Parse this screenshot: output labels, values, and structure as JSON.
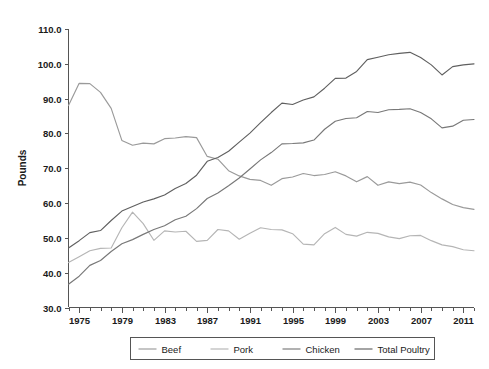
{
  "chart_data": {
    "type": "line",
    "title": "",
    "subtitle": "",
    "xlabel": "",
    "ylabel": "Pounds",
    "xlim": [
      1974,
      2012
    ],
    "ylim": [
      30.0,
      110.0
    ],
    "grid": false,
    "legend_position": "bottom",
    "y_ticks": [
      "30.0",
      "40.0",
      "50.0",
      "60.0",
      "70.0",
      "80.0",
      "90.0",
      "100.0",
      "110.0"
    ],
    "y_tick_values": [
      30,
      40,
      50,
      60,
      70,
      80,
      90,
      100,
      110
    ],
    "x_ticks": [
      "1975",
      "1979",
      "1983",
      "1987",
      "1991",
      "1995",
      "1999",
      "2003",
      "2007",
      "2011"
    ],
    "x_tick_values": [
      1975,
      1979,
      1983,
      1987,
      1991,
      1995,
      1999,
      2003,
      2007,
      2011
    ],
    "x_minor_step": 1,
    "x": [
      1974,
      1975,
      1976,
      1977,
      1978,
      1979,
      1980,
      1981,
      1982,
      1983,
      1984,
      1985,
      1986,
      1987,
      1988,
      1989,
      1990,
      1991,
      1992,
      1993,
      1994,
      1995,
      1996,
      1997,
      1998,
      1999,
      2000,
      2001,
      2002,
      2003,
      2004,
      2005,
      2006,
      2007,
      2008,
      2009,
      2010,
      2011,
      2012
    ],
    "series": [
      {
        "name": "Beef",
        "color": "#9a9a9a",
        "values": [
          88.0,
          94.4,
          94.3,
          91.8,
          87.2,
          78.0,
          76.6,
          77.2,
          77.0,
          78.5,
          78.7,
          79.1,
          78.8,
          73.4,
          72.6,
          69.3,
          67.8,
          66.8,
          66.5,
          65.1,
          67.0,
          67.5,
          68.5,
          67.9,
          68.2,
          69.0,
          67.8,
          66.1,
          67.6,
          65.1,
          66.1,
          65.6,
          66.0,
          65.2,
          63.0,
          61.2,
          59.6,
          58.7,
          58.2
        ]
      },
      {
        "name": "Pork",
        "color": "#b5b5b5",
        "values": [
          42.9,
          44.6,
          46.3,
          47.0,
          47.1,
          52.9,
          57.4,
          54.1,
          49.3,
          52.0,
          51.7,
          51.9,
          49.0,
          49.3,
          52.4,
          52.0,
          49.6,
          51.3,
          52.9,
          52.4,
          52.3,
          51.2,
          48.2,
          48.0,
          51.2,
          53.0,
          51.0,
          50.5,
          51.6,
          51.3,
          50.3,
          49.8,
          50.6,
          50.7,
          49.2,
          48.0,
          47.5,
          46.6,
          46.3
        ]
      },
      {
        "name": "Chicken",
        "color": "#787878",
        "values": [
          36.7,
          39.0,
          42.1,
          43.5,
          46.1,
          48.3,
          49.5,
          51.0,
          52.4,
          53.5,
          55.2,
          56.2,
          58.4,
          61.3,
          62.9,
          65.0,
          67.2,
          69.8,
          72.4,
          74.5,
          77.0,
          77.1,
          77.3,
          78.1,
          81.2,
          83.5,
          84.3,
          84.5,
          86.3,
          86.0,
          86.8,
          86.9,
          87.1,
          86.0,
          84.2,
          81.6,
          82.1,
          83.8,
          84.0
        ]
      },
      {
        "name": "Total Poultry",
        "color": "#606060",
        "values": [
          47.1,
          49.2,
          51.5,
          52.1,
          55.0,
          57.7,
          59.0,
          60.3,
          61.2,
          62.3,
          64.2,
          65.6,
          68.0,
          72.0,
          73.1,
          74.9,
          77.5,
          80.1,
          83.1,
          86.0,
          88.7,
          88.3,
          89.6,
          90.5,
          93.0,
          95.8,
          95.9,
          97.8,
          101.2,
          101.9,
          102.6,
          103.0,
          103.3,
          101.8,
          99.7,
          96.8,
          99.2,
          99.7,
          100.0
        ]
      }
    ]
  },
  "legend": {
    "items": [
      {
        "label": "Beef"
      },
      {
        "label": "Pork"
      },
      {
        "label": "Chicken"
      },
      {
        "label": "Total Poultry"
      }
    ]
  },
  "colors": {
    "beef": "#9a9a9a",
    "pork": "#b5b5b5",
    "chicken": "#787878",
    "total_poultry": "#606060",
    "axis": "#555555",
    "text": "#1a1a1a",
    "background": "#ffffff"
  }
}
